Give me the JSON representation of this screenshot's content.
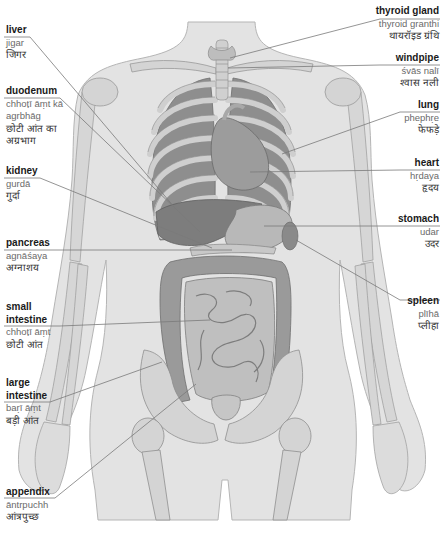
{
  "diagram": {
    "colors": {
      "skin": "#e0e0e0",
      "bone": "#d2d2d2",
      "organ_dark": "#8c8c8c",
      "organ_mid": "#a8a8a8",
      "organ_light": "#c4c4c4",
      "leader_line": "#7a7a7a",
      "label_text": "#1a1a1a",
      "translit_text": "#6a6a6a"
    },
    "labels_left": [
      {
        "id": "liver",
        "english": "liver",
        "translit": "jigar",
        "hindi": "जिगर"
      },
      {
        "id": "duodenum",
        "english": "duodenum",
        "translit": "chhoṭī āṃt kā",
        "translit2": "agrbhāg",
        "hindi": "छोटी आंत का",
        "hindi2": "अग्रभाग"
      },
      {
        "id": "kidney",
        "english": "kidney",
        "translit": "gurdā",
        "hindi": "गुर्दा"
      },
      {
        "id": "pancreas",
        "english": "pancreas",
        "translit": "agnāśaya",
        "hindi": "अग्नाशय"
      },
      {
        "id": "small-intestine",
        "english": "small",
        "english2": "intestine",
        "translit": "chhoṭī āṃt",
        "hindi": "छोटी आंत"
      },
      {
        "id": "large-intestine",
        "english": "large",
        "english2": "intestine",
        "translit": "baṛī āṃt",
        "hindi": "बड़ी आंत"
      },
      {
        "id": "appendix",
        "english": "appendix",
        "translit": "āntrpuchh",
        "hindi": "आंत्रपुच्छ"
      }
    ],
    "labels_right": [
      {
        "id": "thyroid-gland",
        "english": "thyroid gland",
        "translit": "thyroid granthi",
        "hindi": "थायरॉइड ग्रंथि"
      },
      {
        "id": "windpipe",
        "english": "windpipe",
        "translit": "śvās nalī",
        "hindi": "श्वास नली"
      },
      {
        "id": "lung",
        "english": "lung",
        "translit": "phephṛe",
        "hindi": "फेफड़े"
      },
      {
        "id": "heart",
        "english": "heart",
        "translit": "hṛdaya",
        "hindi": "हृदय"
      },
      {
        "id": "stomach",
        "english": "stomach",
        "translit": "udar",
        "hindi": "उदर"
      },
      {
        "id": "spleen",
        "english": "spleen",
        "translit": "plīhā",
        "hindi": "प्लीहा"
      }
    ]
  }
}
